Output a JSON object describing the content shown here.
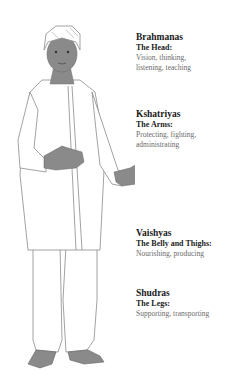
{
  "diagram": {
    "type": "illustrated-body-map",
    "colors": {
      "skin": "#8a8a8a",
      "skin_dark": "#6f6f6f",
      "outline": "#7a7a7a",
      "clothing": "#ffffff",
      "heading": "#1a1a1a",
      "body_text": "#6a6a6a"
    },
    "castes": [
      {
        "name": "Brahmanas",
        "part": "The Head:",
        "role_lines": [
          "Vision, thinking,",
          "listening, teaching"
        ]
      },
      {
        "name": "Kshatriyas",
        "part": "The Arms:",
        "role_lines": [
          "Protecting, fighting,",
          "administrating"
        ]
      },
      {
        "name": "Vaishyas",
        "part": "The Belly and Thighs:",
        "role_lines": [
          "Nourishing, producing"
        ]
      },
      {
        "name": "Shudras",
        "part": "The Legs:",
        "role_lines": [
          "Supporting, transporting"
        ]
      }
    ]
  }
}
